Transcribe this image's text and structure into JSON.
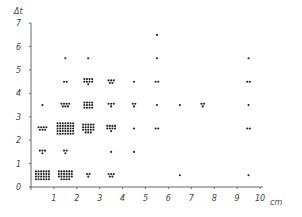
{
  "chart_data": {
    "type": "scatter",
    "title": "",
    "xlabel": "cm",
    "ylabel": "Δt",
    "xlim": [
      0,
      10
    ],
    "ylim": [
      0,
      7
    ],
    "xticks": [
      1,
      2,
      3,
      4,
      5,
      6,
      7,
      8,
      9,
      10
    ],
    "yticks": [
      0,
      1,
      2,
      3,
      4,
      5,
      6,
      7
    ],
    "grid": false,
    "legend": null,
    "note": "Each dot is one observation; points are clustered in bins of 1 unit, centered at half-integer positions. Counts are estimated per cell.",
    "cells": [
      {
        "x": 0.5,
        "y": 0.5,
        "count": 24
      },
      {
        "x": 0.5,
        "y": 1.5,
        "count": 4
      },
      {
        "x": 0.5,
        "y": 2.5,
        "count": 7
      },
      {
        "x": 0.5,
        "y": 3.5,
        "count": 1
      },
      {
        "x": 1.5,
        "y": 0.5,
        "count": 22
      },
      {
        "x": 1.5,
        "y": 1.5,
        "count": 3
      },
      {
        "x": 1.5,
        "y": 2.5,
        "count": 35
      },
      {
        "x": 1.5,
        "y": 3.5,
        "count": 7
      },
      {
        "x": 1.5,
        "y": 4.5,
        "count": 2
      },
      {
        "x": 1.5,
        "y": 5.5,
        "count": 1
      },
      {
        "x": 2.5,
        "y": 0.5,
        "count": 3
      },
      {
        "x": 2.5,
        "y": 2.5,
        "count": 18
      },
      {
        "x": 2.5,
        "y": 3.5,
        "count": 12
      },
      {
        "x": 2.5,
        "y": 4.5,
        "count": 9
      },
      {
        "x": 2.5,
        "y": 5.5,
        "count": 1
      },
      {
        "x": 3.5,
        "y": 0.5,
        "count": 5
      },
      {
        "x": 3.5,
        "y": 1.5,
        "count": 1
      },
      {
        "x": 3.5,
        "y": 2.5,
        "count": 9
      },
      {
        "x": 3.5,
        "y": 3.5,
        "count": 4
      },
      {
        "x": 3.5,
        "y": 4.5,
        "count": 5
      },
      {
        "x": 4.5,
        "y": 1.5,
        "count": 1
      },
      {
        "x": 4.5,
        "y": 2.5,
        "count": 1
      },
      {
        "x": 4.5,
        "y": 3.5,
        "count": 3
      },
      {
        "x": 4.5,
        "y": 4.5,
        "count": 1
      },
      {
        "x": 5.5,
        "y": 2.5,
        "count": 2
      },
      {
        "x": 5.5,
        "y": 3.5,
        "count": 1
      },
      {
        "x": 5.5,
        "y": 4.5,
        "count": 2
      },
      {
        "x": 5.5,
        "y": 5.5,
        "count": 1
      },
      {
        "x": 5.5,
        "y": 6.5,
        "count": 1
      },
      {
        "x": 6.5,
        "y": 0.5,
        "count": 1
      },
      {
        "x": 6.5,
        "y": 3.5,
        "count": 1
      },
      {
        "x": 7.5,
        "y": 3.5,
        "count": 3
      },
      {
        "x": 9.5,
        "y": 0.5,
        "count": 1
      },
      {
        "x": 9.5,
        "y": 2.5,
        "count": 2
      },
      {
        "x": 9.5,
        "y": 3.5,
        "count": 1
      },
      {
        "x": 9.5,
        "y": 4.5,
        "count": 2
      },
      {
        "x": 9.5,
        "y": 5.5,
        "count": 1
      }
    ]
  },
  "style": {
    "point_color": "#222222",
    "axis_color": "#666666",
    "background": "#ffffff"
  }
}
